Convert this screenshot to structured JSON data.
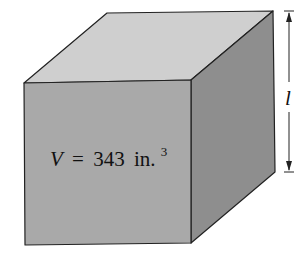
{
  "figure": {
    "type": "cube",
    "volume_label": {
      "variable": "V",
      "equals": "=",
      "value": "343",
      "unit": "in.",
      "exponent": "3"
    },
    "dimension_label": "l",
    "colors": {
      "top_face": "#cfcfcf",
      "front_face": "#a9a9a9",
      "right_face": "#8e8e8e",
      "edge": "#222222",
      "background": "#ffffff"
    }
  }
}
